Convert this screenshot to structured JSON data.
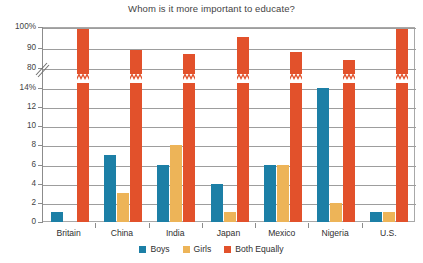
{
  "chart_data": {
    "type": "bar",
    "title": "Whom is it more important to educate?",
    "xlabel": "",
    "ylabel": "",
    "categories": [
      "Britain",
      "China",
      "India",
      "Japan",
      "Mexico",
      "Nigeria",
      "U.S."
    ],
    "series": [
      {
        "name": "Boys",
        "color": "#1c7fa6",
        "values": [
          1,
          7,
          6,
          4,
          6,
          14,
          1
        ]
      },
      {
        "name": "Girls",
        "color": "#edb458",
        "values": [
          0,
          3,
          8,
          1,
          6,
          2,
          1
        ]
      },
      {
        "name": "Both Equally",
        "color": "#e2512b",
        "values": [
          99,
          89,
          87,
          95,
          88,
          84,
          99
        ]
      }
    ],
    "axis_break": true,
    "lower_ylim": [
      0,
      14
    ],
    "upper_ylim": [
      80,
      100
    ],
    "ytick_labels": [
      "100%",
      "90",
      "80",
      "14%",
      "12",
      "10",
      "8",
      "6",
      "4",
      "2",
      "0"
    ],
    "ytick_values": [
      100,
      90,
      80,
      14,
      12,
      10,
      8,
      6,
      4,
      2,
      0
    ],
    "grid": true,
    "legend_position": "bottom"
  },
  "legend": {
    "items": [
      {
        "label": "Boys",
        "color": "#1c7fa6"
      },
      {
        "label": "Girls",
        "color": "#edb458"
      },
      {
        "label": "Both Equally",
        "color": "#e2512b"
      }
    ]
  }
}
